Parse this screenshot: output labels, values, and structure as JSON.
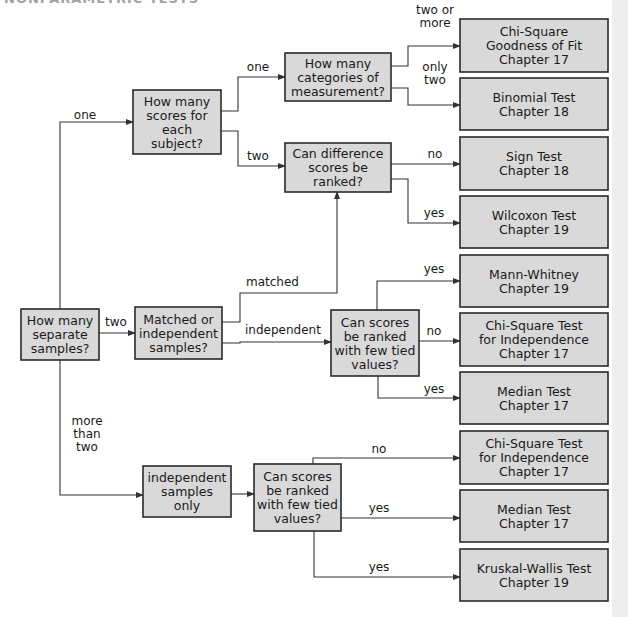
{
  "header": {
    "cropped_title": "NONPARAMETRIC TESTS"
  },
  "nodes": [
    {
      "id": "root",
      "kind": "decision",
      "lines": [
        "How many",
        "separate",
        "samples?"
      ]
    },
    {
      "id": "scores_per_subject",
      "kind": "decision",
      "lines": [
        "How many",
        "scores for",
        "each",
        "subject?"
      ]
    },
    {
      "id": "categories",
      "kind": "decision",
      "lines": [
        "How many",
        "categories of",
        "measurement?"
      ]
    },
    {
      "id": "diff_ranked",
      "kind": "decision",
      "lines": [
        "Can difference",
        "scores be",
        "ranked?"
      ]
    },
    {
      "id": "matched_indep",
      "kind": "decision",
      "lines": [
        "Matched or",
        "independent",
        "samples?"
      ]
    },
    {
      "id": "ranked_ties_2",
      "kind": "decision",
      "lines": [
        "Can scores",
        "be ranked",
        "with few tied",
        "values?"
      ]
    },
    {
      "id": "indep_only",
      "kind": "decision",
      "lines": [
        "independent",
        "samples",
        "only"
      ]
    },
    {
      "id": "ranked_ties_3",
      "kind": "decision",
      "lines": [
        "Can scores",
        "be ranked",
        "with few tied",
        "values?"
      ]
    },
    {
      "id": "r_chisq_gof",
      "kind": "result",
      "lines": [
        "Chi-Square",
        "Goodness of Fit",
        "Chapter 17"
      ]
    },
    {
      "id": "r_binomial",
      "kind": "result",
      "lines": [
        "Binomial Test",
        "Chapter 18"
      ]
    },
    {
      "id": "r_sign",
      "kind": "result",
      "lines": [
        "Sign Test",
        "Chapter 18"
      ]
    },
    {
      "id": "r_wilcoxon",
      "kind": "result",
      "lines": [
        "Wilcoxon Test",
        "Chapter 19"
      ]
    },
    {
      "id": "r_mann_whitney",
      "kind": "result",
      "lines": [
        "Mann-Whitney",
        "Chapter 19"
      ]
    },
    {
      "id": "r_chisq_indep_2",
      "kind": "result",
      "lines": [
        "Chi-Square Test",
        "for Independence",
        "Chapter 17"
      ]
    },
    {
      "id": "r_median_2",
      "kind": "result",
      "lines": [
        "Median Test",
        "Chapter 17"
      ]
    },
    {
      "id": "r_chisq_indep_3",
      "kind": "result",
      "lines": [
        "Chi-Square Test",
        "for Independence",
        "Chapter 17"
      ]
    },
    {
      "id": "r_median_3",
      "kind": "result",
      "lines": [
        "Median Test",
        "Chapter 17"
      ]
    },
    {
      "id": "r_kruskal",
      "kind": "result",
      "lines": [
        "Kruskal-Wallis Test",
        "Chapter 19"
      ]
    }
  ],
  "edges": [
    {
      "from": "root",
      "to": "scores_per_subject",
      "label": [
        "one"
      ]
    },
    {
      "from": "root",
      "to": "matched_indep",
      "label": [
        "two"
      ]
    },
    {
      "from": "root",
      "to": "indep_only",
      "label": [
        "more",
        "than",
        "two"
      ]
    },
    {
      "from": "scores_per_subject",
      "to": "categories",
      "label": [
        "one"
      ]
    },
    {
      "from": "scores_per_subject",
      "to": "diff_ranked",
      "label": [
        "two"
      ]
    },
    {
      "from": "categories",
      "to": "r_chisq_gof",
      "label": [
        "two or",
        "more"
      ]
    },
    {
      "from": "categories",
      "to": "r_binomial",
      "label": [
        "only",
        "two"
      ]
    },
    {
      "from": "diff_ranked",
      "to": "r_sign",
      "label": [
        "no"
      ]
    },
    {
      "from": "diff_ranked",
      "to": "r_wilcoxon",
      "label": [
        "yes"
      ]
    },
    {
      "from": "matched_indep",
      "to": "diff_ranked",
      "label": [
        "matched"
      ]
    },
    {
      "from": "matched_indep",
      "to": "ranked_ties_2",
      "label": [
        "independent"
      ]
    },
    {
      "from": "ranked_ties_2",
      "to": "r_mann_whitney",
      "label": [
        "yes"
      ]
    },
    {
      "from": "ranked_ties_2",
      "to": "r_chisq_indep_2",
      "label": [
        "no"
      ]
    },
    {
      "from": "ranked_ties_2",
      "to": "r_median_2",
      "label": [
        "yes"
      ]
    },
    {
      "from": "indep_only",
      "to": "ranked_ties_3",
      "label": []
    },
    {
      "from": "ranked_ties_3",
      "to": "r_chisq_indep_3",
      "label": [
        "no"
      ]
    },
    {
      "from": "ranked_ties_3",
      "to": "r_median_3",
      "label": [
        "yes"
      ]
    },
    {
      "from": "ranked_ties_3",
      "to": "r_kruskal",
      "label": [
        "yes"
      ]
    }
  ],
  "colors": {
    "box_fill": "#d9d9d9",
    "box_stroke": "#2a2a2a",
    "line": "#333333"
  }
}
